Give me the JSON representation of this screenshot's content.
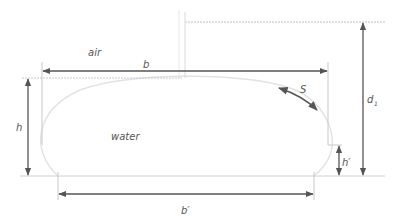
{
  "diagram": {
    "labels": {
      "air": "air",
      "water": "water",
      "b": "b",
      "b_prime": "b′",
      "h": "h",
      "h_prime": "h′",
      "d1": "d",
      "d1_sub": "1",
      "S": "S"
    },
    "colors": {
      "arrow": "#555555",
      "guide": "#c8c8c8",
      "droplet": "#e2e2e2",
      "text": "#555555"
    }
  }
}
